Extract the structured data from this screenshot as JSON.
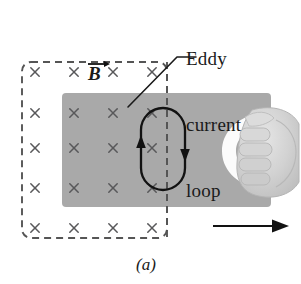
{
  "figure": {
    "caption": "(a)",
    "annotation": {
      "lines": [
        "Eddy",
        "current",
        "loop"
      ],
      "target": "eddy-current-loop"
    },
    "field_label": "B",
    "field_label_notation": "vector-arrow-overbar",
    "field_direction": "into-page",
    "field_marker_glyph": "×",
    "field_marker_rows": 5,
    "field_marker_cols": 4,
    "motion_arrow": {
      "direction": "right",
      "label": ""
    },
    "loop_circulation": "counterclockwise",
    "loop_left_arrow_direction": "up",
    "loop_right_arrow_direction": "down",
    "hand_description": "hand gripping plate edge"
  },
  "colors": {
    "plate_gray": "#a9a9a9",
    "plate_gray_edge": "#9c9c9c",
    "ink": "#1a1a1a",
    "dash_gray": "#555555",
    "marker_gray": "#58585a",
    "hand_light": "#dcdcdc",
    "hand_mid": "#c6c6c6",
    "hand_shadow": "#b0b0b0",
    "highlight_white": "#ffffff",
    "background": "#ffffff"
  },
  "geometry": {
    "dashed_region": {
      "x": 22,
      "y": 62,
      "w": 145,
      "h": 176
    },
    "plate": {
      "x": 62,
      "y": 93,
      "w": 209,
      "h": 114
    },
    "loop": {
      "cx": 163,
      "cy": 149,
      "rx": 22,
      "ry": 55
    },
    "markers_x": [
      35,
      74,
      113,
      152
    ],
    "markers_y": [
      72,
      113,
      148,
      188,
      228
    ]
  }
}
